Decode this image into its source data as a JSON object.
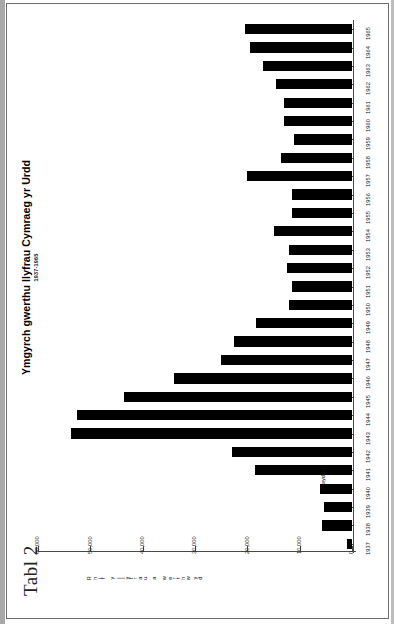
{
  "figure": {
    "caption": "Tabl 2",
    "title": "Ymgyrch gwerthu llyfrau Cymraeg yr Urdd",
    "subtitle": "1937-1965"
  },
  "colors": {
    "bar": "#000000",
    "axis": "#4a4a4a",
    "text": "#111111",
    "background": "#ffffff"
  },
  "chart_data": {
    "type": "bar",
    "orientation": "vertical",
    "title": "Ymgyrch gwerthu llyfrau Cymraeg yr Urdd",
    "subtitle": "1937-1965",
    "xlabel": "Blwyddyn",
    "ylabel": "Rhif y llyfrau a werthwyd",
    "ylim": [
      0,
      60000
    ],
    "grid": false,
    "legend": null,
    "ytick_labels": [
      "0",
      "10,000",
      "20,000",
      "30,000",
      "40,000",
      "50,000",
      "60,000"
    ],
    "ytick_values": [
      0,
      10000,
      20000,
      30000,
      40000,
      50000,
      60000
    ],
    "categories": [
      "1937",
      "1938",
      "1939",
      "1940",
      "1941",
      "1942",
      "1943",
      "1944",
      "1945",
      "1946",
      "1947",
      "1948",
      "1949",
      "1950",
      "1951",
      "1952",
      "1953",
      "1954",
      "1955",
      "1956",
      "1957",
      "1958",
      "1959",
      "1960",
      "1961",
      "1962",
      "1963",
      "1964",
      "1965"
    ],
    "values": [
      1000,
      5700,
      5400,
      6100,
      18500,
      23000,
      53700,
      52500,
      43500,
      34000,
      25000,
      22500,
      18300,
      12000,
      11500,
      12500,
      12000,
      15000,
      11500,
      11500,
      20000,
      13500,
      11000,
      13000,
      13000,
      14500,
      17000,
      19500,
      20500
    ]
  }
}
